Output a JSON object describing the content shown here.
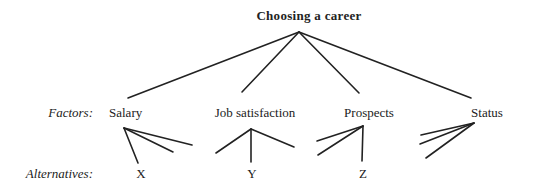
{
  "diagram": {
    "title": "Choosing a career",
    "row_labels": {
      "factors": "Factors:",
      "alternatives": "Alternatives:"
    },
    "factors": [
      {
        "label": "Salary"
      },
      {
        "label": "Job satisfaction"
      },
      {
        "label": "Prospects"
      },
      {
        "label": "Status"
      }
    ],
    "alternatives": [
      {
        "label": "X"
      },
      {
        "label": "Y"
      },
      {
        "label": "Z"
      }
    ],
    "line_color": "#222222"
  }
}
